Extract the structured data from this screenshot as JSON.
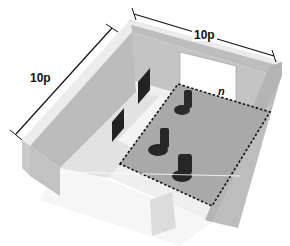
{
  "diagram": {
    "type": "isometric room layout",
    "dimensions": {
      "width_label": "10p",
      "depth_label": "10p",
      "zone_label": "n"
    },
    "elements": [
      {
        "name": "back-wall",
        "description": "back wall of room"
      },
      {
        "name": "left-wall",
        "description": "left side wall"
      },
      {
        "name": "projection-screen",
        "description": "white screen on back wall"
      },
      {
        "name": "console-desk",
        "description": "long desk with two monitors and keyboards"
      },
      {
        "name": "monitors",
        "count": 2
      },
      {
        "name": "chairs",
        "count": 3
      },
      {
        "name": "dashed-zone",
        "description": "dashed rectangle marking operator zone n"
      },
      {
        "name": "floor-sign",
        "description": "faint sign on floor near entrance"
      }
    ],
    "colors": {
      "wall": "#b9b9b9",
      "wall_top": "#e8e8e8",
      "floor": "#eeeeee",
      "zone_floor": "#a8a8a8",
      "screen": "#ffffff",
      "monitor": "#222222",
      "chair": "#2a2a2a",
      "dash": "#111111"
    }
  }
}
